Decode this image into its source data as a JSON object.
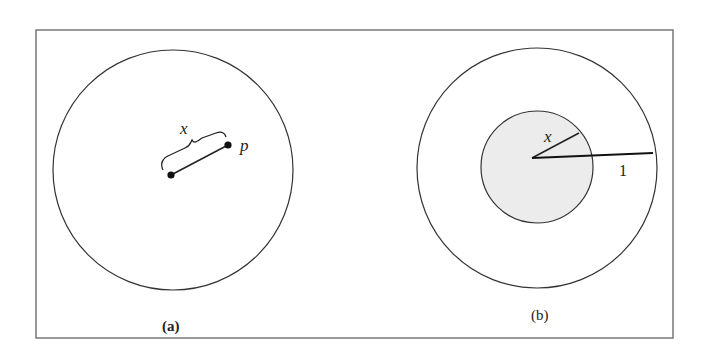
{
  "figure": {
    "panel_a": {
      "caption": "(a)",
      "distance_label": "x",
      "point_label": "p"
    },
    "panel_b": {
      "caption": "(b)",
      "inner_radius_label": "x",
      "outer_radius_label": "1"
    },
    "colors": {
      "stroke": "#333333",
      "frame": "#777777",
      "inner_fill": "#ececec",
      "background": "#ffffff"
    }
  }
}
